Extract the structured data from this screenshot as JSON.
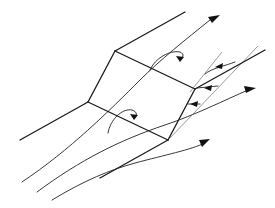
{
  "diagram": {
    "title": "",
    "colors": {
      "line": "#1a1a1a",
      "background": "#ffffff"
    },
    "labels": []
  }
}
